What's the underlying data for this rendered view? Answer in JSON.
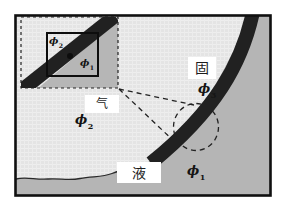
{
  "figure": {
    "caption_labels": {
      "solid": "固",
      "gas": "气",
      "liquid": "液"
    },
    "phase_symbols": {
      "solid": {
        "base": "ϕ",
        "sub": "3"
      },
      "gas": {
        "base": "ϕ",
        "sub": "2"
      },
      "liquid": {
        "base": "ϕ",
        "sub": "1"
      }
    },
    "inset_symbols": {
      "gas": {
        "base": "ϕ",
        "sub": "2"
      },
      "liquid": {
        "base": "ϕ",
        "sub": "1"
      }
    },
    "colors": {
      "background": "#ffffff",
      "gas_region": "#e4e4e4",
      "liquid_region": "#b5b5b5",
      "solid_band": "#212121",
      "frame_border": "#101010",
      "label_box": "#ffffff",
      "dashed_lines": "#222222"
    }
  }
}
